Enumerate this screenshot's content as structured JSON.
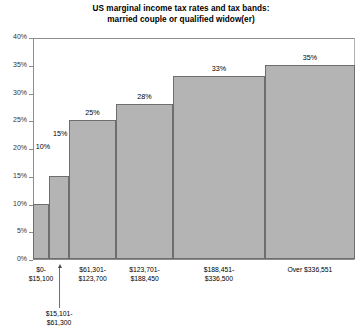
{
  "chart_data": {
    "type": "bar",
    "title": "US marginal income tax rates and tax bands:",
    "subtitle": "married couple or qualified widow(er)",
    "xlabel": "",
    "ylabel": "",
    "ylim": [
      0,
      40
    ],
    "ytick_labels": [
      "0%",
      "5%",
      "10%",
      "15%",
      "20%",
      "25%",
      "30%",
      "35%",
      "40%"
    ],
    "ytick_values": [
      0,
      5,
      10,
      15,
      20,
      25,
      30,
      35,
      40
    ],
    "grid": false,
    "legend": "none",
    "categories": [
      "$0-$15,100",
      "$15,101-$61,300",
      "$61,301-$123,700",
      "$123,701-$188,450",
      "$188,451-$336,500",
      "Over $336,551"
    ],
    "values": [
      10,
      15,
      25,
      28,
      33,
      35
    ],
    "value_labels": [
      "10%",
      "15%",
      "25%",
      "28%",
      "33%",
      "35%"
    ],
    "bands": [
      {
        "line1": "$0-",
        "line2": "$15,100",
        "rate_label": "10%",
        "rate": 10,
        "label_style": "inline-left",
        "x_start_pct": 0.0,
        "x_end_pct": 5.0
      },
      {
        "line1": "$15,101-",
        "line2": "$61,300",
        "rate_label": "15%",
        "rate": 15,
        "label_style": "callout",
        "x_start_pct": 5.0,
        "x_end_pct": 11.2
      },
      {
        "line1": "$61,301-",
        "line2": "$123,700",
        "rate_label": "25%",
        "rate": 25,
        "label_style": "axis",
        "x_start_pct": 11.2,
        "x_end_pct": 25.8
      },
      {
        "line1": "$123,701-",
        "line2": "$188,450",
        "rate_label": "28%",
        "rate": 28,
        "label_style": "axis",
        "x_start_pct": 25.8,
        "x_end_pct": 43.5
      },
      {
        "line1": "$188,451-",
        "line2": "$336,500",
        "rate_label": "33%",
        "rate": 33,
        "label_style": "axis",
        "x_start_pct": 43.5,
        "x_end_pct": 72.0
      },
      {
        "line1": "Over $336,551",
        "line2": "",
        "rate_label": "35%",
        "rate": 35,
        "label_style": "axis",
        "x_start_pct": 72.0,
        "x_end_pct": 100.0
      }
    ],
    "colors": {
      "bar_fill": "#b4b4b4",
      "bar_stroke": "#6e6e6e",
      "axis": "#8c8c8c",
      "text": "#000000",
      "background": "#ffffff"
    }
  }
}
